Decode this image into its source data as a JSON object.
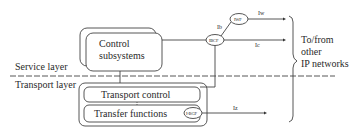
{
  "diagram": {
    "layers": {
      "service": "Service layer",
      "transport": "Transport layer"
    },
    "boxes": {
      "control_subsystems_line1": "Control",
      "control_subsystems_line2": "subsystems",
      "transport_control": "Transport control",
      "transfer_functions": "Transfer functions"
    },
    "nodes": {
      "ibcf": "IBCF",
      "iwf": "IWF",
      "bgf": "I-BGF"
    },
    "interfaces": {
      "ib": "Ib",
      "iw": "Iw",
      "ic": "Ic",
      "iz": "Iz"
    },
    "external": {
      "line1": "To/from",
      "line2": "other",
      "line3": "IP networks"
    }
  }
}
